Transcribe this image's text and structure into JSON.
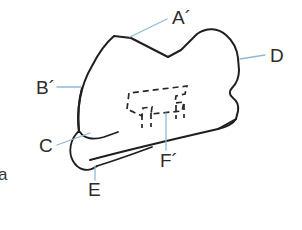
{
  "figure": {
    "caption_partial": "a",
    "background_color": "#ffffff",
    "outline_color": "#211d1c",
    "hidden_line_color": "#2b2724",
    "leader_color": "#8fb9d6",
    "label_color": "#2e2b29"
  },
  "labels": [
    {
      "id": "A-prime",
      "text": "A´",
      "x": 172,
      "y": 22,
      "leader": {
        "x1": 130,
        "y1": 37,
        "x2": 165,
        "y2": 20
      }
    },
    {
      "id": "B-prime",
      "text": "B´",
      "x": 38,
      "y": 92,
      "leader": {
        "x1": 58,
        "y1": 86,
        "x2": 80,
        "y2": 86
      }
    },
    {
      "id": "C",
      "text": "C",
      "x": 41,
      "y": 148,
      "leader": {
        "x1": 58,
        "y1": 143,
        "x2": 88,
        "y2": 134
      }
    },
    {
      "id": "D",
      "text": "D",
      "x": 270,
      "y": 60,
      "leader": {
        "x1": 241,
        "y1": 58,
        "x2": 263,
        "y2": 55
      }
    },
    {
      "id": "E",
      "text": "E",
      "x": 90,
      "y": 192,
      "leader": {
        "x1": 95,
        "y1": 166,
        "x2": 95,
        "y2": 180
      }
    },
    {
      "id": "F-prime",
      "text": "F´",
      "x": 164,
      "y": 163,
      "leader": {
        "x1": 166,
        "y1": 113,
        "x2": 166,
        "y2": 150
      }
    }
  ],
  "geometry": {
    "outline_description": "closed irregular panel with rounded top-left peak, central V notch, rounded right lobe with lower step notch, curved lower-left edge",
    "outline_path": "M 79 132 C 76 112 80 86 92 66 C 99 53 107 43 114 37 L 130 38 L 168 57 L 180 51 L 196 34 C 206 28 216 28 224 34 C 232 40 236 48 238 57 L 239 70 C 239 78 236 83 232 87 C 229 90 229 95 233 98 C 237 101 239 105 238 111 L 236 119 C 233 124 226 127 218 129 L 150 139 L 98 147 C 89 148 82 142 79 132 Z",
    "cuff_path": "M 79 132 C 82 142 89 148 98 147 L 150 139 L 218 129 L 236 119",
    "cuff_band_outer": "M 78 133 C 70 140 69 152 74 161 C 79 170 89 172 98 167 L 155 142 L 225 123",
    "cuff_band_inner": "M 79 132 C 74 138 73 148 77 156 C 81 163 88 165 96 161 L 152 136",
    "hem_tick": "M 113 131 L 118 141",
    "hidden_shape_path": "M 126 108 L 128 93 L 186 87 L 184 94 L 176 95 L 174 102 L 183 101 L 181 110 L 150 113 L 151 106 L 142 107 L 141 115 L 126 108 Z",
    "hidden_legs": [
      "M 141 113 L 141 127",
      "M 150 112 L 150 126",
      "M 176 104 L 176 118",
      "M 183 103 L 183 117"
    ]
  }
}
